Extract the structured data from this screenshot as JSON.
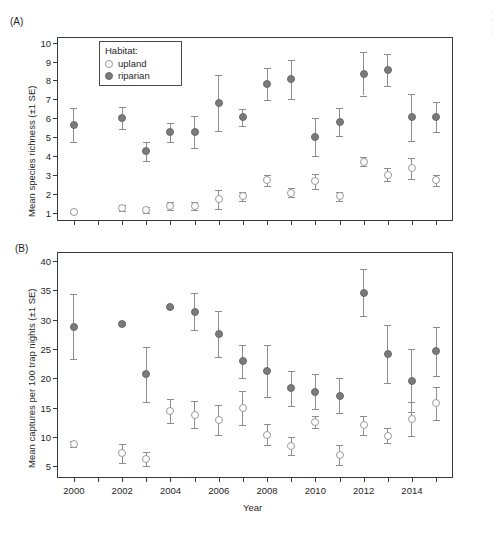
{
  "figure": {
    "panel_a_letter": "(A)",
    "panel_b_letter": "(B)"
  },
  "legend": {
    "title": "Habitat:",
    "items": [
      {
        "label": "upland",
        "marker": "open-circle",
        "color": "#ffffff"
      },
      {
        "label": "riparian",
        "marker": "filled-circle",
        "color": "#7a7a7a"
      }
    ]
  },
  "margin_note": [
    "l",
    "s",
    "(",
    "l"
  ],
  "chart_data": [
    {
      "id": "panel-a",
      "type": "scatter",
      "title": "(A)",
      "xlabel": "",
      "ylabel": "Mean species richness (±1 SE)",
      "xlim": [
        1999.3,
        2015.7
      ],
      "ylim": [
        0.55,
        10.3
      ],
      "yticks": [
        1,
        2,
        3,
        4,
        5,
        6,
        7,
        8,
        9,
        10
      ],
      "xticks": [
        2000,
        2002,
        2004,
        2006,
        2008,
        2010,
        2012,
        2014
      ],
      "xtick_labels": [
        "2000",
        "2002",
        "2004",
        "2006",
        "2008",
        "2010",
        "2012",
        "2014"
      ],
      "grid": false,
      "legend_position": "top-left-inside",
      "x": [
        2000,
        2001,
        2002,
        2003,
        2004,
        2005,
        2006,
        2007,
        2008,
        2009,
        2010,
        2011,
        2012,
        2013,
        2014,
        2015
      ],
      "series": [
        {
          "name": "riparian",
          "marker": "filled-circle",
          "color": "#7a7a7a",
          "values": [
            5.65,
            null,
            6.0,
            4.25,
            5.25,
            5.25,
            6.8,
            6.05,
            7.8,
            8.05,
            5.0,
            5.8,
            8.35,
            8.55,
            6.05,
            6.05
          ],
          "err_low": [
            4.75,
            null,
            5.4,
            3.75,
            4.75,
            4.4,
            5.3,
            5.6,
            6.95,
            7.0,
            4.0,
            5.05,
            7.2,
            7.7,
            4.8,
            5.25
          ],
          "err_high": [
            6.55,
            null,
            6.6,
            4.75,
            5.75,
            6.1,
            8.3,
            6.5,
            8.65,
            9.1,
            6.0,
            6.55,
            9.5,
            9.4,
            7.3,
            6.85
          ]
        },
        {
          "name": "upland",
          "marker": "open-circle",
          "color": "#ffffff",
          "values": [
            1.05,
            null,
            1.25,
            1.15,
            1.35,
            1.35,
            1.7,
            1.85,
            2.7,
            2.05,
            2.65,
            1.85,
            3.7,
            3.0,
            3.35,
            2.7
          ],
          "err_low": [
            1.0,
            null,
            1.1,
            1.0,
            1.15,
            1.15,
            1.2,
            1.6,
            2.4,
            1.8,
            2.25,
            1.6,
            3.45,
            2.65,
            2.8,
            2.4
          ],
          "err_high": [
            1.1,
            null,
            1.4,
            1.3,
            1.55,
            1.55,
            2.2,
            2.1,
            3.0,
            2.3,
            3.05,
            2.1,
            3.95,
            3.35,
            3.9,
            3.0
          ]
        }
      ]
    },
    {
      "id": "panel-b",
      "type": "scatter",
      "title": "(B)",
      "xlabel": "Year",
      "ylabel": "Mean captures per 100 trap nights (±1 SE)",
      "xlim": [
        1999.3,
        2015.7
      ],
      "ylim": [
        3.0,
        41.5
      ],
      "yticks": [
        5,
        10,
        15,
        20,
        25,
        30,
        35,
        40
      ],
      "xticks": [
        2000,
        2002,
        2004,
        2006,
        2008,
        2010,
        2012,
        2014
      ],
      "xtick_labels": [
        "2000",
        "2002",
        "2004",
        "2006",
        "2008",
        "2010",
        "2012",
        "2014"
      ],
      "grid": false,
      "legend_position": "none",
      "x": [
        2000,
        2001,
        2002,
        2003,
        2004,
        2005,
        2006,
        2007,
        2008,
        2009,
        2010,
        2011,
        2012,
        2013,
        2014,
        2015
      ],
      "series": [
        {
          "name": "riparian",
          "marker": "filled-circle",
          "color": "#7a7a7a",
          "values": [
            28.8,
            null,
            29.3,
            20.7,
            32.1,
            31.3,
            27.5,
            22.9,
            21.2,
            18.3,
            17.7,
            17.0,
            34.6,
            24.1,
            19.6,
            24.6
          ],
          "err_low": [
            23.2,
            null,
            29.0,
            16.0,
            31.9,
            28.2,
            23.6,
            20.1,
            16.8,
            15.3,
            14.7,
            14.0,
            30.6,
            19.1,
            14.2,
            20.4
          ],
          "err_high": [
            34.4,
            null,
            29.6,
            25.4,
            32.3,
            34.6,
            31.4,
            25.7,
            25.6,
            21.3,
            20.7,
            20.0,
            38.6,
            29.1,
            25.0,
            28.8
          ]
        },
        {
          "name": "upland",
          "marker": "open-circle",
          "color": "#ffffff",
          "values": [
            8.8,
            null,
            7.2,
            6.3,
            14.4,
            13.8,
            12.9,
            14.9,
            10.4,
            8.5,
            12.6,
            6.9,
            12.0,
            10.2,
            13.1,
            15.7
          ],
          "err_low": [
            8.3,
            null,
            5.6,
            5.1,
            12.3,
            11.5,
            10.4,
            12.0,
            8.6,
            7.0,
            11.6,
            5.2,
            10.4,
            8.9,
            10.2,
            12.9
          ],
          "err_high": [
            9.3,
            null,
            8.8,
            7.5,
            16.5,
            16.1,
            15.4,
            17.8,
            12.2,
            10.0,
            13.6,
            8.6,
            13.6,
            11.5,
            16.0,
            18.5
          ]
        }
      ]
    }
  ]
}
